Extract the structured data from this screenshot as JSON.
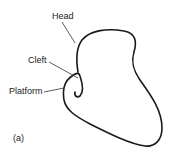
{
  "figure": {
    "panel_label": "(a)",
    "labels": {
      "head": "Head",
      "cleft": "Cleft",
      "platform": "Platform"
    },
    "stroke_color": "#1a1a1a",
    "background": "#ffffff"
  }
}
